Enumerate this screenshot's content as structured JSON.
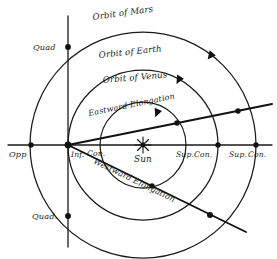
{
  "diagram": {
    "orbits": {
      "mars": "Orbit of Mars",
      "earth": "Orbit of Earth",
      "venus": "Orbit of Venus"
    },
    "elongations": {
      "eastward": "Eastward Elongation",
      "westward": "Westward Elongation"
    },
    "bodies": {
      "sun": "Sun"
    },
    "configurations": {
      "opposition": "Opp",
      "quadrature_top": "Quad",
      "quadrature_bottom": "Quad.",
      "inferior_conjunction_a": "Inf.",
      "inferior_conjunction_b": "Con.",
      "superior_conjunction_1a": "Sup.",
      "superior_conjunction_1b": "Con.",
      "superior_conjunction_2a": "Sup.",
      "superior_conjunction_2b": "Con."
    },
    "colors": {
      "ink": "#1a1a1a",
      "background": "#ffffff"
    }
  }
}
